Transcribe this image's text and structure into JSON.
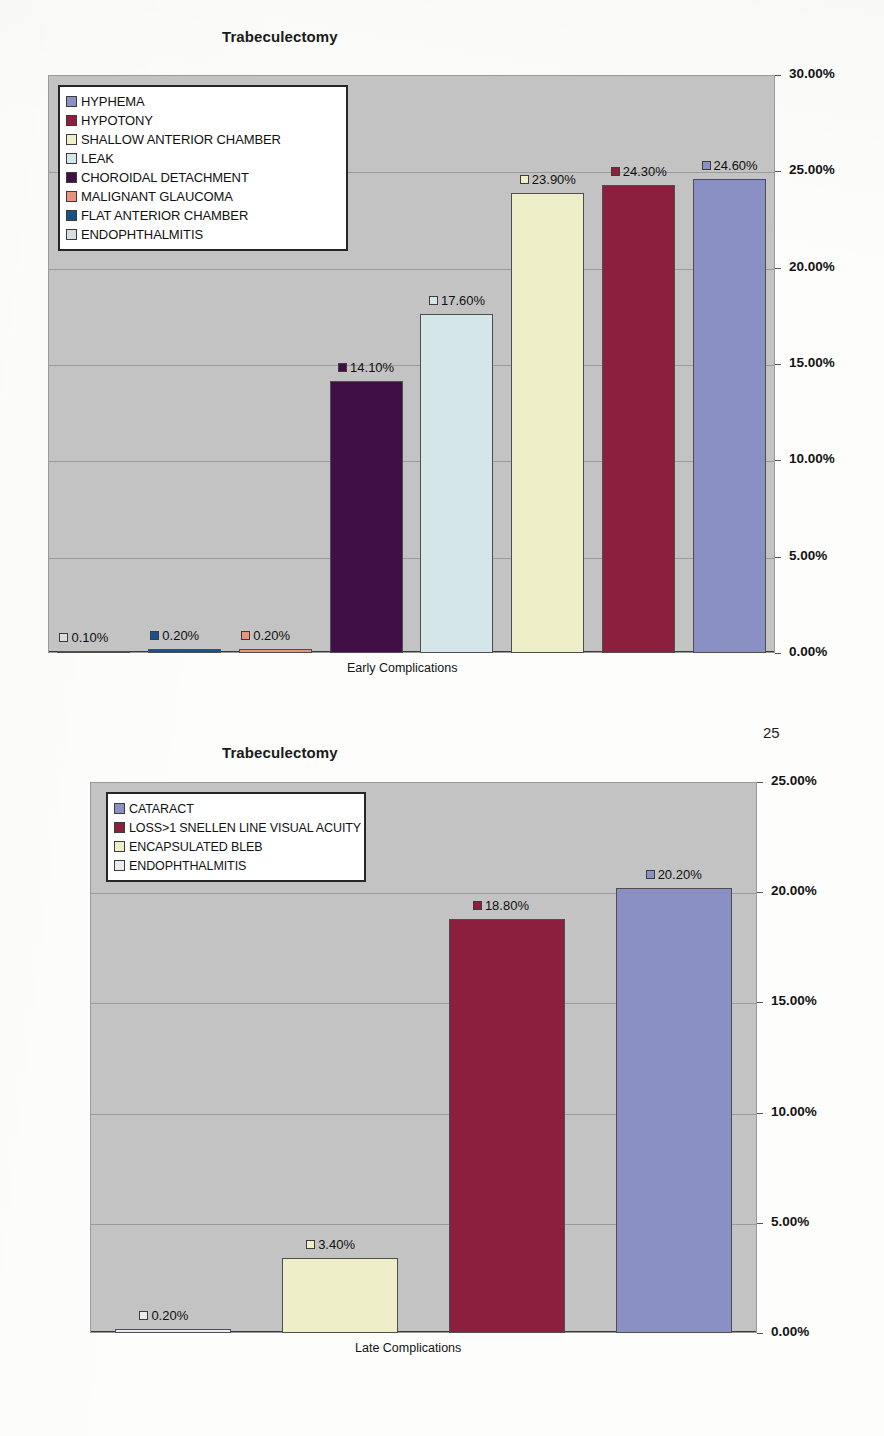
{
  "page": {
    "number": "25"
  },
  "charts": [
    {
      "title": "Trabeculectomy",
      "xlabel": "Early  Complications",
      "legend": [
        {
          "label": "HYPHEMA",
          "color": "#8b90c4"
        },
        {
          "label": "HYPOTONY",
          "color": "#8c1f3d"
        },
        {
          "label": "SHALLOW ANTERIOR CHAMBER",
          "color": "#eeeec8"
        },
        {
          "label": "LEAK",
          "color": "#d5e6e8"
        },
        {
          "label": "CHOROIDAL DETACHMENT",
          "color": "#3f0f46"
        },
        {
          "label": "MALIGNANT GLAUCOMA",
          "color": "#e8947e"
        },
        {
          "label": "FLAT ANTERIOR CHAMBER",
          "color": "#1a4e8c"
        },
        {
          "label": "ENDOPHTHALMITIS",
          "color": "#d9dde0"
        }
      ],
      "ticks": [
        "30.00%",
        "25.00%",
        "20.00%",
        "15.00%",
        "10.00%",
        "5.00%",
        "0.00%"
      ],
      "labels": [
        "0.10%",
        "0.20%",
        "0.20%",
        "14.10%",
        "17.60%",
        "23.90%",
        "24.30%",
        "24.60%"
      ]
    },
    {
      "title": "Trabeculectomy",
      "xlabel": "Late Complications",
      "legend": [
        {
          "label": "CATARACT",
          "color": "#8b90c4"
        },
        {
          "label": "LOSS>1 SNELLEN LINE VISUAL ACUITY",
          "color": "#8c1f3d"
        },
        {
          "label": "ENCAPSULATED BLEB",
          "color": "#eeeec8"
        },
        {
          "label": "ENDOPHTHALMITIS",
          "color": "#e8ecee"
        }
      ],
      "ticks": [
        "25.00%",
        "20.00%",
        "15.00%",
        "10.00%",
        "5.00%",
        "0.00%"
      ],
      "labels": [
        "0.20%",
        "3.40%",
        "18.80%",
        "20.20%"
      ]
    }
  ],
  "chart_data": [
    {
      "type": "bar",
      "title": "Trabeculectomy",
      "xlabel": "Early  Complications",
      "ylabel": "",
      "ylim": [
        0,
        30
      ],
      "grid": true,
      "legend_position": "top-left",
      "categories": [
        "ENDOPHTHALMITIS",
        "FLAT ANTERIOR CHAMBER",
        "MALIGNANT GLAUCOMA",
        "CHOROIDAL DETACHMENT",
        "LEAK",
        "SHALLOW ANTERIOR CHAMBER",
        "HYPOTONY",
        "HYPHEMA"
      ],
      "values": [
        0.1,
        0.2,
        0.2,
        14.1,
        17.6,
        23.9,
        24.3,
        24.6
      ],
      "data_labels": [
        "0.10%",
        "0.20%",
        "0.20%",
        "14.10%",
        "17.60%",
        "23.90%",
        "24.30%",
        "24.60%"
      ],
      "colors": [
        "#d9dde0",
        "#1a4e8c",
        "#e8947e",
        "#3f0f46",
        "#d5e6e8",
        "#eeeec8",
        "#8c1f3d",
        "#8b90c4"
      ],
      "tick_labels": [
        "0.00%",
        "5.00%",
        "10.00%",
        "15.00%",
        "20.00%",
        "25.00%",
        "30.00%"
      ],
      "tick_values": [
        0,
        5,
        10,
        15,
        20,
        25,
        30
      ]
    },
    {
      "type": "bar",
      "title": "Trabeculectomy",
      "xlabel": "Late Complications",
      "ylabel": "",
      "ylim": [
        0,
        25
      ],
      "grid": true,
      "legend_position": "top-left",
      "categories": [
        "ENDOPHTHALMITIS",
        "ENCAPSULATED BLEB",
        "LOSS>1 SNELLEN LINE VISUAL ACUITY",
        "CATARACT"
      ],
      "values": [
        0.2,
        3.4,
        18.8,
        20.2
      ],
      "data_labels": [
        "0.20%",
        "3.40%",
        "18.80%",
        "20.20%"
      ],
      "colors": [
        "#e8ecee",
        "#eeeec8",
        "#8c1f3d",
        "#8b90c4"
      ],
      "tick_labels": [
        "0.00%",
        "5.00%",
        "10.00%",
        "15.00%",
        "20.00%",
        "25.00%"
      ],
      "tick_values": [
        0,
        5,
        10,
        15,
        20,
        25
      ]
    }
  ]
}
